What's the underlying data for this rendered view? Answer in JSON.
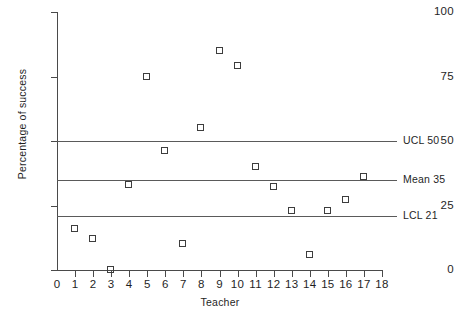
{
  "chart_data": {
    "type": "scatter",
    "title": "",
    "xlabel": "Teacher",
    "ylabel": "Percentage of success",
    "xlim": [
      0,
      18
    ],
    "ylim": [
      0,
      100
    ],
    "grid": false,
    "legend": "none",
    "x_ticks": [
      0,
      1,
      2,
      3,
      4,
      5,
      6,
      7,
      8,
      9,
      10,
      11,
      12,
      13,
      14,
      15,
      16,
      17,
      18
    ],
    "y_ticks": [
      0,
      25,
      50,
      75,
      100
    ],
    "x": [
      1,
      2,
      3,
      4,
      5,
      6,
      7,
      8,
      9,
      10,
      11,
      12,
      13,
      14,
      15,
      16,
      17
    ],
    "values": [
      16,
      12,
      0,
      33,
      75,
      46,
      10,
      55,
      85,
      79,
      40,
      32,
      23,
      6,
      23,
      27,
      36
    ],
    "series": [
      {
        "name": "Percentage of success",
        "marker": "open-square",
        "values": [
          16,
          12,
          0,
          33,
          75,
          46,
          10,
          55,
          85,
          79,
          40,
          32,
          23,
          6,
          23,
          27,
          36
        ]
      }
    ],
    "reference_lines": [
      {
        "id": "ucl",
        "label": "UCL 50",
        "value": 50
      },
      {
        "id": "mean",
        "label": "Mean 35",
        "value": 35
      },
      {
        "id": "lcl",
        "label": "LCL 21",
        "value": 21
      }
    ]
  }
}
